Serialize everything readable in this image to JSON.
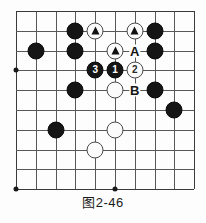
{
  "figure": {
    "caption": "图2-46",
    "kind": "go-board-diagram"
  },
  "board": {
    "columns": 10,
    "rows": 10,
    "spacing_px": 19.8,
    "origin_x_px": 17,
    "origin_y_px": 12,
    "line_color": "#585858",
    "edge_color": "#3a3a3a",
    "background_color": "#fdfdfd"
  },
  "star_points": [
    {
      "name": "hoshi-left",
      "col": 0,
      "row": 3
    },
    {
      "name": "hoshi-bottom-left",
      "col": 0,
      "row": 9
    },
    {
      "name": "hoshi-bottom-center",
      "col": 5,
      "row": 9
    }
  ],
  "stones": [
    {
      "name": "black-stone-c3r1",
      "color": "black",
      "col": 3,
      "row": 1,
      "mark": ""
    },
    {
      "name": "white-stone-c4r1",
      "color": "white",
      "col": 4,
      "row": 1,
      "mark": "triangle"
    },
    {
      "name": "white-stone-c6r1",
      "color": "white",
      "col": 6,
      "row": 1,
      "mark": "triangle"
    },
    {
      "name": "black-stone-c7r1",
      "color": "black",
      "col": 7,
      "row": 1,
      "mark": ""
    },
    {
      "name": "black-stone-c1r2",
      "color": "black",
      "col": 1,
      "row": 2,
      "mark": ""
    },
    {
      "name": "black-stone-c3r2",
      "color": "black",
      "col": 3,
      "row": 2,
      "mark": ""
    },
    {
      "name": "white-stone-c5r2",
      "color": "white",
      "col": 5,
      "row": 2,
      "mark": "triangle"
    },
    {
      "name": "black-stone-c7r2",
      "color": "black",
      "col": 7,
      "row": 2,
      "mark": ""
    },
    {
      "name": "black-stone-move-3",
      "color": "black",
      "col": 4,
      "row": 3,
      "mark": "3"
    },
    {
      "name": "black-stone-move-1",
      "color": "black",
      "col": 5,
      "row": 3,
      "mark": "1"
    },
    {
      "name": "white-stone-move-2",
      "color": "white",
      "col": 6,
      "row": 3,
      "mark": "2"
    },
    {
      "name": "black-stone-c3r4",
      "color": "black",
      "col": 3,
      "row": 4,
      "mark": ""
    },
    {
      "name": "white-stone-c5r4",
      "color": "white",
      "col": 5,
      "row": 4,
      "mark": ""
    },
    {
      "name": "black-stone-c7r4",
      "color": "black",
      "col": 7,
      "row": 4,
      "mark": ""
    },
    {
      "name": "black-stone-c8r5",
      "color": "black",
      "col": 8,
      "row": 5,
      "mark": ""
    },
    {
      "name": "black-stone-c2r6",
      "color": "black",
      "col": 2,
      "row": 6,
      "mark": ""
    },
    {
      "name": "white-stone-c5r6",
      "color": "white",
      "col": 5,
      "row": 6,
      "mark": ""
    },
    {
      "name": "white-stone-c4r7",
      "color": "white",
      "col": 4,
      "row": 7,
      "mark": ""
    }
  ],
  "point_labels": [
    {
      "name": "point-label-a",
      "text": "A",
      "col": 6,
      "row": 2
    },
    {
      "name": "point-label-b",
      "text": "B",
      "col": 6,
      "row": 4
    }
  ]
}
